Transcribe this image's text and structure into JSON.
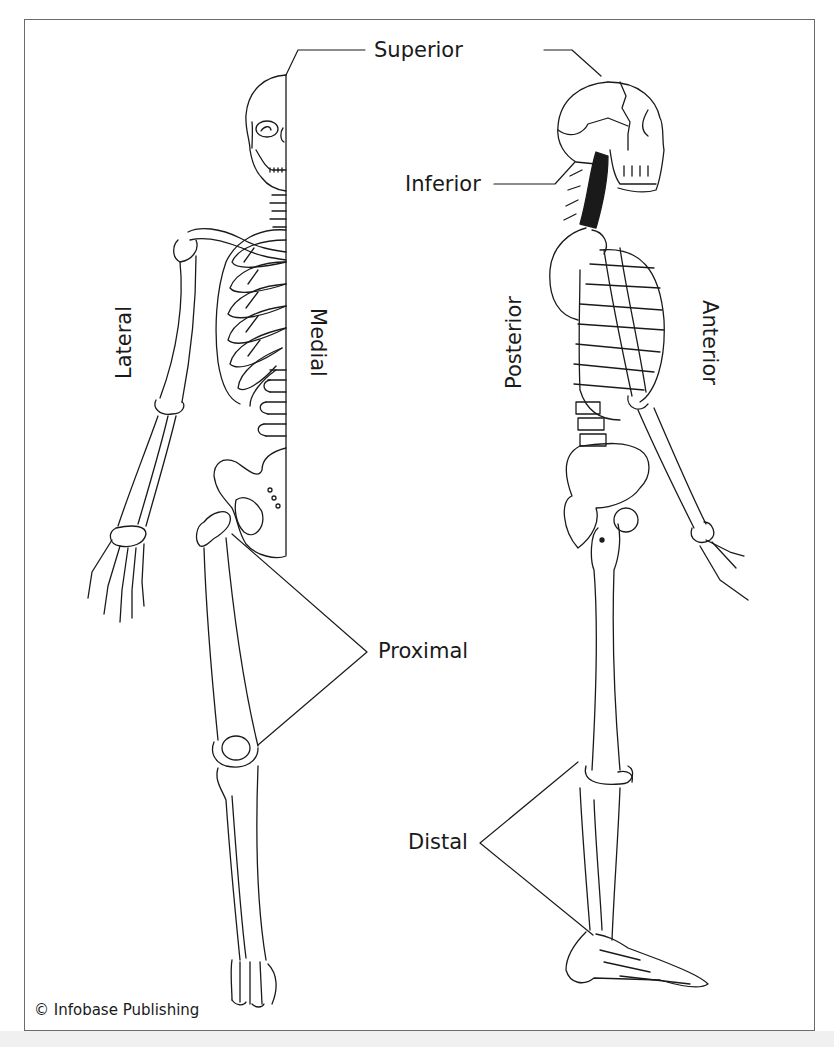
{
  "figure": {
    "labels": {
      "superior": "Superior",
      "inferior": "Inferior",
      "lateral": "Lateral",
      "medial": "Medial",
      "posterior": "Posterior",
      "anterior": "Anterior",
      "proximal": "Proximal",
      "distal": "Distal"
    },
    "views": [
      {
        "name": "anterior-half-view",
        "description": "Front view of half skeleton divided at the midline"
      },
      {
        "name": "lateral-view",
        "description": "Side view of skeleton facing right"
      }
    ],
    "credit": "© Infobase Publishing",
    "colors": {
      "line": "#1a1a1a",
      "frame": "#6b6b6b",
      "background": "#ffffff",
      "strip": "#f0f0f0"
    }
  }
}
